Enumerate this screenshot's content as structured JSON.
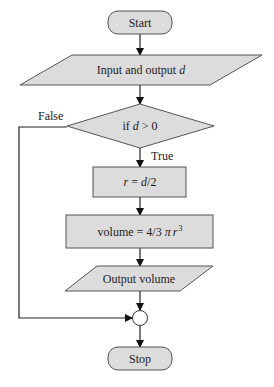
{
  "diagram": {
    "type": "flowchart",
    "colors": {
      "fill": "#dcdcdc",
      "stroke": "#555555",
      "line": "#222222"
    },
    "nodes": [
      {
        "id": "start",
        "shape": "terminator",
        "label": "Start"
      },
      {
        "id": "input",
        "shape": "parallelogram",
        "label_prefix": "Input and output ",
        "label_var": "d"
      },
      {
        "id": "decision",
        "shape": "diamond",
        "label_prefix": "if ",
        "label_var": "d",
        "label_suffix": " > 0"
      },
      {
        "id": "radius",
        "shape": "rectangle",
        "label_var1": "r",
        "label_mid": " = ",
        "label_var2": "d",
        "label_suffix": "/2"
      },
      {
        "id": "volume",
        "shape": "rectangle",
        "label_prefix": "volume = 4/3 ",
        "label_pi": "π",
        "label_var": "r",
        "label_exp": "3"
      },
      {
        "id": "output",
        "shape": "parallelogram",
        "label": "Output volume"
      },
      {
        "id": "join",
        "shape": "connector",
        "label": ""
      },
      {
        "id": "stop",
        "shape": "terminator",
        "label": "Stop"
      }
    ],
    "edges": [
      {
        "from": "start",
        "to": "input",
        "label": ""
      },
      {
        "from": "input",
        "to": "decision",
        "label": ""
      },
      {
        "from": "decision",
        "to": "radius",
        "label": "True"
      },
      {
        "from": "radius",
        "to": "volume",
        "label": ""
      },
      {
        "from": "volume",
        "to": "output",
        "label": ""
      },
      {
        "from": "output",
        "to": "join",
        "label": ""
      },
      {
        "from": "decision",
        "to": "join",
        "label": "False"
      },
      {
        "from": "join",
        "to": "stop",
        "label": ""
      }
    ]
  }
}
